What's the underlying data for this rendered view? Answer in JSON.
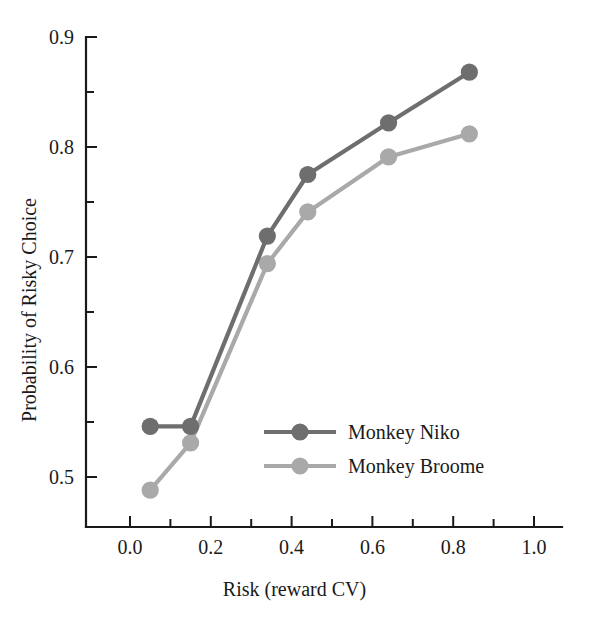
{
  "chart_data": {
    "type": "line",
    "title": "",
    "xlabel": "Risk (reward CV)",
    "ylabel": "Probability of Risky Choice",
    "xlim": [
      -0.07,
      1.07
    ],
    "ylim": [
      0.468,
      0.903
    ],
    "grid": false,
    "legend_position": "center-right-inside",
    "x": [
      0.05,
      0.15,
      0.34,
      0.44,
      0.64,
      0.84
    ],
    "xticks": [
      0.0,
      0.1,
      0.2,
      0.3,
      0.4,
      0.5,
      0.6,
      0.7,
      0.8,
      0.9,
      1.0
    ],
    "xtick_labels": [
      "0.0",
      "",
      "0.2",
      "",
      "0.4",
      "",
      "0.6",
      "",
      "0.8",
      "",
      "1.0"
    ],
    "yticks": [
      0.5,
      0.55,
      0.6,
      0.65,
      0.7,
      0.75,
      0.8,
      0.85,
      0.9
    ],
    "ytick_labels": [
      "0.5",
      "",
      "0.6",
      "",
      "0.7",
      "",
      "0.8",
      "",
      "0.9"
    ],
    "series": [
      {
        "name": "Monkey Niko",
        "color": "#6e6e6e",
        "marker": "circle",
        "values": [
          0.546,
          0.546,
          0.719,
          0.775,
          0.822,
          0.868
        ]
      },
      {
        "name": "Monkey Broome",
        "color": "#a9a9a9",
        "marker": "circle",
        "values": [
          0.488,
          0.531,
          0.694,
          0.741,
          0.791,
          0.812
        ]
      }
    ]
  },
  "axes": {
    "x_title": "Risk (reward CV)",
    "y_title": "Probability of Risky Choice",
    "x_tick_labels": [
      "0.0",
      "0.2",
      "0.4",
      "0.6",
      "0.8",
      "1.0"
    ],
    "y_tick_labels": [
      "0.5",
      "0.6",
      "0.7",
      "0.8",
      "0.9"
    ]
  },
  "legend": {
    "entries": [
      {
        "label": "Monkey Niko",
        "color": "#6e6e6e"
      },
      {
        "label": "Monkey Broome",
        "color": "#a9a9a9"
      }
    ]
  },
  "colors": {
    "niko": "#6e6e6e",
    "broome": "#a9a9a9",
    "axis": "#1a1a1a",
    "background": "#ffffff"
  }
}
